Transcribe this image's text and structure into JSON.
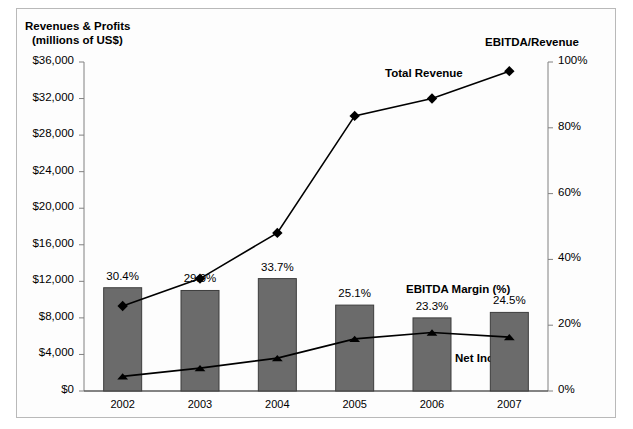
{
  "axes": {
    "left_title_line1": "Revenues & Profits",
    "left_title_line2": "(millions of US$)",
    "right_title": "EBITDA/Revenue",
    "left_ticks": [
      "$36,000",
      "$32,000",
      "$28,000",
      "$24,000",
      "$20,000",
      "$16,000",
      "$12,000",
      "$8,000",
      "$4,000",
      "$0"
    ],
    "right_ticks": [
      "100%",
      "80%",
      "60%",
      "40%",
      "20%",
      "0%"
    ]
  },
  "annotations": {
    "total_revenue": "Total Revenue",
    "ebitda_margin": "EBITDA Margin (%)",
    "net_income": "Net Income"
  },
  "colors": {
    "bar_fill": "#6b6b6b",
    "bar_stroke": "#3d3d3d",
    "line": "#000000",
    "axis": "#808080",
    "frame": "#b9b9b9",
    "background": "#fdfdfd"
  },
  "chart_data": {
    "type": "bar",
    "title": "Revenues & Profits (millions of US$)",
    "xlabel": "",
    "ylabel": "Revenues & Profits (millions of US$)",
    "y2label": "EBITDA/Revenue",
    "ylim": [
      0,
      36000
    ],
    "y2lim": [
      0,
      100
    ],
    "ytick_step": 4000,
    "y2tick_step": 20,
    "grid": false,
    "legend": "annotations-inline",
    "categories": [
      "2002",
      "2003",
      "2004",
      "2005",
      "2006",
      "2007"
    ],
    "series": [
      {
        "name": "EBITDA Margin (%)",
        "type": "bar",
        "axis": "left",
        "values": [
          11300,
          11000,
          12300,
          9400,
          8000,
          8600
        ],
        "data_labels": [
          "30.4%",
          "29.9%",
          "33.7%",
          "25.1%",
          "23.3%",
          "24.5%"
        ],
        "label_values": [
          30.4,
          29.9,
          33.7,
          25.1,
          23.3,
          24.5
        ]
      },
      {
        "name": "Total Revenue",
        "type": "line",
        "axis": "left",
        "marker": "diamond",
        "values": [
          9300,
          12300,
          17300,
          30100,
          32000,
          35000
        ]
      },
      {
        "name": "Net Income",
        "type": "line",
        "axis": "left",
        "marker": "triangle",
        "values": [
          1600,
          2500,
          3600,
          5700,
          6400,
          5900
        ]
      }
    ]
  }
}
